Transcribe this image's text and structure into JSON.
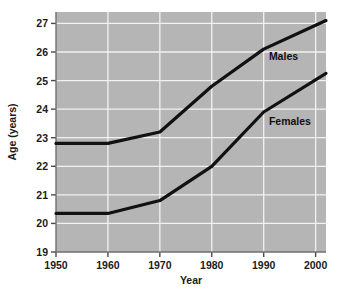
{
  "chart_data": {
    "type": "line",
    "title": "",
    "subtitle": "",
    "xlabel": "Year",
    "ylabel": "Age (years)",
    "xlim": [
      1950,
      2002
    ],
    "ylim": [
      19,
      27.4
    ],
    "xticks": [
      1950,
      1960,
      1970,
      1980,
      1990,
      2000
    ],
    "xtick_labels": [
      "1950",
      "1960",
      "1970",
      "1980",
      "1990",
      "2000"
    ],
    "yticks": [
      19,
      20,
      21,
      22,
      23,
      24,
      25,
      26,
      27
    ],
    "ytick_labels": [
      "19",
      "20",
      "21",
      "22",
      "23",
      "24",
      "25",
      "26",
      "27"
    ],
    "grid": true,
    "grid_color": "#f2f2f2",
    "plot_background": "#b5b5b5",
    "page_background": "#ffffff",
    "line_color": "#111111",
    "legend_position": "inline-annotations",
    "series": [
      {
        "name": "Males",
        "label_text": "Males",
        "label_x": 1991,
        "label_y": 25.72,
        "x": [
          1950,
          1960,
          1970,
          1980,
          1990,
          2002
        ],
        "values": [
          22.8,
          22.8,
          23.2,
          24.8,
          26.1,
          27.1
        ]
      },
      {
        "name": "Females",
        "label_text": "Females",
        "label_x": 1991,
        "label_y": 23.45,
        "x": [
          1950,
          1960,
          1970,
          1980,
          1990,
          2002
        ],
        "values": [
          20.35,
          20.35,
          20.8,
          22.0,
          23.9,
          25.25
        ]
      }
    ]
  }
}
